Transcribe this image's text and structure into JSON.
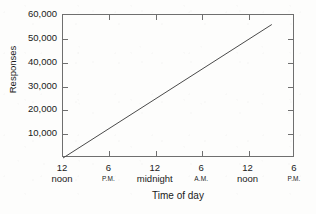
{
  "chart_data": {
    "type": "line",
    "title": "",
    "xlabel": "Time of day",
    "ylabel": "Responses",
    "grid": false,
    "legend": "none",
    "ylim": [
      0,
      60000
    ],
    "xlim": [
      0,
      30
    ],
    "y_ticks": [
      {
        "value": 60000,
        "label": "60,000"
      },
      {
        "value": 50000,
        "label": "50,000"
      },
      {
        "value": 40000,
        "label": "40,000"
      },
      {
        "value": 30000,
        "label": "30,000"
      },
      {
        "value": 20000,
        "label": "20,000"
      },
      {
        "value": 10000,
        "label": "10,000"
      }
    ],
    "x_ticks": [
      {
        "value": 0,
        "label": "12",
        "sublabel": "noon",
        "sublabel_small": false
      },
      {
        "value": 6,
        "label": "6",
        "sublabel": "P.M.",
        "sublabel_small": true
      },
      {
        "value": 12,
        "label": "12",
        "sublabel": "midnight",
        "sublabel_small": false
      },
      {
        "value": 18,
        "label": "6",
        "sublabel": "A.M.",
        "sublabel_small": true
      },
      {
        "value": 24,
        "label": "12",
        "sublabel": "noon",
        "sublabel_small": false
      },
      {
        "value": 30,
        "label": "6",
        "sublabel": "P.M.",
        "sublabel_small": true
      }
    ],
    "series": [
      {
        "name": "Cumulative responses",
        "color": "#4a4a4a",
        "x": [
          0,
          27
        ],
        "values": [
          0,
          56000
        ]
      }
    ]
  },
  "figure": {
    "background_color": "#fdfdfc",
    "frame_color": "#6f6f6f",
    "text_color": "#1a1a1a"
  }
}
